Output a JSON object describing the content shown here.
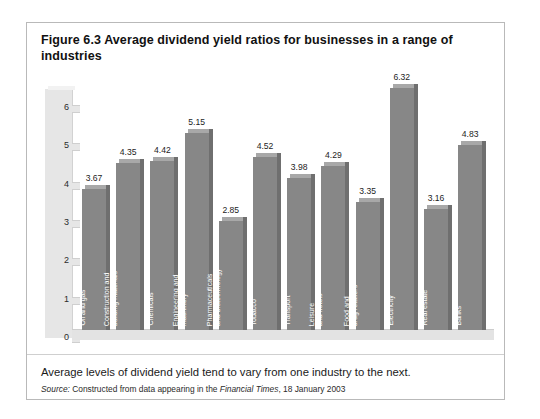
{
  "figure": {
    "number": "Figure 6.3",
    "title": "Figure 6.3  Average dividend yield ratios for businesses in a range of industries",
    "caption": "Average levels of dividend yield tend to vary from one industry to the next.",
    "source_prefix": "Source:",
    "source_text_1": "Constructed from data appearing in the",
    "source_italic": "Financial Times",
    "source_text_2": ", 18 January 2003"
  },
  "chart_data": {
    "type": "bar",
    "title": "Average dividend yield ratios for businesses in a range of industries",
    "xlabel": "",
    "ylabel": "",
    "ylim": [
      0,
      6.5
    ],
    "yticks": [
      "0",
      "1",
      "2",
      "3",
      "4",
      "5",
      "6"
    ],
    "grid": false,
    "legend": "none",
    "bar_color": "#878787",
    "categories": [
      "Oil and gas",
      "Construction and building materials",
      "Chemicals",
      "Engineering and machinery",
      "Pharmaceuticals and biotechnology",
      "Tobacco",
      "Transport",
      "Leisure and hotels",
      "Food and drug retailers",
      "Electricity",
      "Real estate",
      "Banks"
    ],
    "category_lines": [
      [
        "Oil and gas"
      ],
      [
        "Construction and",
        "building materials"
      ],
      [
        "Chemicals"
      ],
      [
        "Engineering and",
        "machinery"
      ],
      [
        "Pharmaceuticals",
        "and biotechnology"
      ],
      [
        "Tobacco"
      ],
      [
        "Transport"
      ],
      [
        "Leisure",
        "and hotels"
      ],
      [
        "Food and",
        "drug retailers"
      ],
      [
        "Electricity"
      ],
      [
        "Real estate"
      ],
      [
        "Banks"
      ]
    ],
    "values": [
      3.67,
      4.35,
      4.42,
      5.15,
      2.85,
      4.52,
      3.98,
      4.29,
      3.35,
      6.32,
      3.16,
      4.83
    ],
    "value_labels": [
      "3.67",
      "4.35",
      "4.42",
      "5.15",
      "2.85",
      "4.52",
      "3.98",
      "4.29",
      "3.35",
      "6.32",
      "3.16",
      "4.83"
    ]
  }
}
